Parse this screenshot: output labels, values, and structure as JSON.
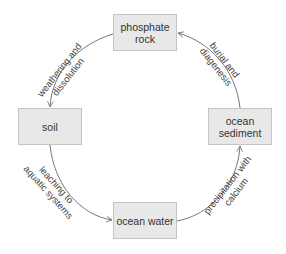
{
  "diagram": {
    "type": "cycle",
    "nodes": [
      {
        "id": "phosphate_rock",
        "lines": [
          "phosphate",
          "rock"
        ],
        "x": 113,
        "y": 14,
        "w": 64,
        "h": 37
      },
      {
        "id": "soil",
        "lines": [
          "soil"
        ],
        "x": 18,
        "y": 108,
        "w": 64,
        "h": 37
      },
      {
        "id": "ocean_sediment",
        "lines": [
          "ocean",
          "sediment"
        ],
        "x": 208,
        "y": 108,
        "w": 64,
        "h": 37
      },
      {
        "id": "ocean_water",
        "lines": [
          "ocean water"
        ],
        "x": 113,
        "y": 202,
        "w": 64,
        "h": 37
      }
    ],
    "edges": [
      {
        "from": "phosphate_rock",
        "to": "soil",
        "label": [
          "weathering and",
          "dissolution"
        ]
      },
      {
        "from": "soil",
        "to": "ocean_water",
        "label": [
          "leaching to",
          "aquatic systems"
        ]
      },
      {
        "from": "ocean_water",
        "to": "ocean_sediment",
        "label": [
          "precipitation with",
          "calcium"
        ]
      },
      {
        "from": "ocean_sediment",
        "to": "phosphate_rock",
        "label": [
          "burial and",
          "diagenesis"
        ]
      }
    ],
    "colors": {
      "node_fill": "#e8e8e8",
      "node_border": "#c4c4c4",
      "edge": "#777777",
      "text": "#333333"
    }
  }
}
